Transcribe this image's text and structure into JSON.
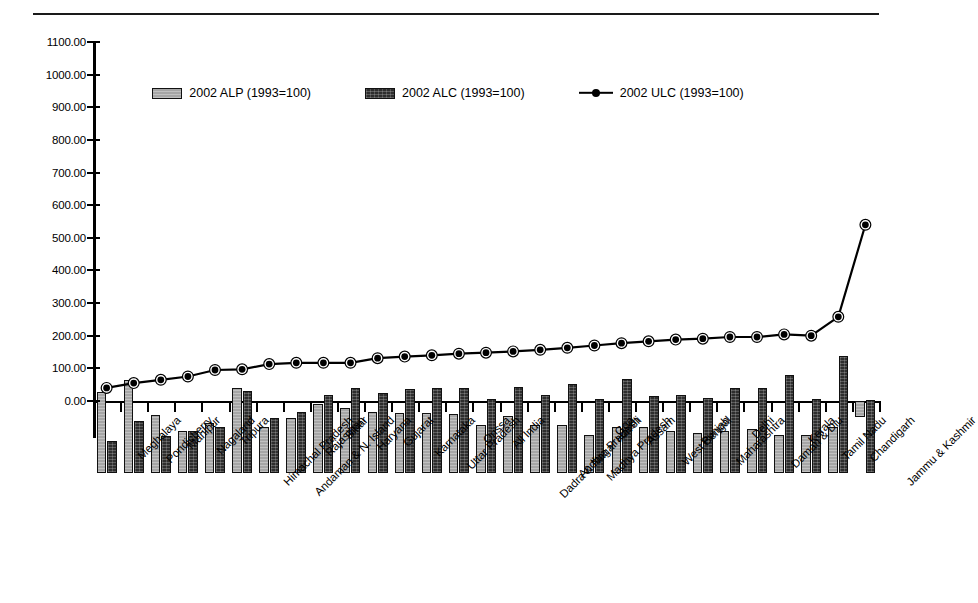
{
  "chart_data": {
    "type": "bar",
    "title": "",
    "subtitle": "",
    "xlabel": "",
    "ylabel": "",
    "ylim": [
      0,
      1100
    ],
    "ytick_step": 100,
    "ytick_labels": [
      "0.00",
      "100.00",
      "200.00",
      "300.00",
      "400.00",
      "500.00",
      "600.00",
      "700.00",
      "800.00",
      "900.00",
      "1000.00",
      "1100.00"
    ],
    "grid": false,
    "legend_position": "top-center",
    "base_year_note": "1993=100",
    "categories": [
      "Meghalaya",
      "Pondicherry",
      "Manipur",
      "Nagaland",
      "Tripura",
      "Himachal Pradesh",
      "Andaman & N. Island",
      "Rajasthan",
      "Bihar",
      "Haryana",
      "Gujarat",
      "Karnataka",
      "Uttar Pradesh",
      "Orissa",
      "All India",
      "Dadra & Nagar Haveli",
      "Andhra Pradesh",
      "Madhya Pradesh",
      "Goa",
      "Assam",
      "West Bengal",
      "Punjab",
      "Maharashtra",
      "Delhi",
      "Daman & Diu",
      "Kerala",
      "Tamil Nadu",
      "Chandigarh",
      "Jammu & Kashmir"
    ],
    "series": [
      {
        "name": "2002 ALP (1993=100)",
        "key": "alp",
        "style": "bar",
        "color": "#a6a6a6",
        "values": [
          248,
          285,
          178,
          128,
          152,
          262,
          142,
          168,
          213,
          200,
          188,
          184,
          184,
          182,
          147,
          174,
          147,
          148,
          117,
          140,
          140,
          128,
          122,
          130,
          136,
          118,
          118,
          142,
          -50
        ]
      },
      {
        "name": "2002 ALC (1993=100)",
        "key": "alc",
        "style": "bar",
        "color": "#2e2e2e",
        "values": [
          97,
          158,
          113,
          130,
          140,
          250,
          170,
          188,
          240,
          262,
          246,
          258,
          262,
          262,
          226,
          264,
          238,
          272,
          228,
          288,
          236,
          238,
          230,
          262,
          262,
          300,
          228,
          360,
          225
        ]
      },
      {
        "name": "2002 ULC (1993=100)",
        "key": "ulc",
        "style": "line",
        "color": "#000000",
        "marker": "circle",
        "values": [
          40,
          55,
          65,
          75,
          95,
          97,
          113,
          117,
          117,
          117,
          131,
          136,
          140,
          145,
          148,
          152,
          157,
          163,
          170,
          177,
          183,
          188,
          191,
          196,
          196,
          204,
          200,
          258,
          540
        ]
      }
    ]
  },
  "legend": {
    "items": [
      {
        "label": "2002 ALP (1993=100)",
        "swatch": "alp"
      },
      {
        "label": "2002 ALC (1993=100)",
        "swatch": "alc"
      },
      {
        "label": "2002 ULC (1993=100)",
        "swatch": "line"
      }
    ]
  }
}
